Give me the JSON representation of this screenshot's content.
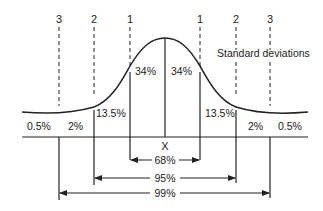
{
  "diagram": {
    "legend_label": "Standard deviations",
    "sd_labels": {
      "left_3": "3",
      "left_2": "2",
      "left_1": "1",
      "right_1": "1",
      "right_2": "2",
      "right_3": "3"
    },
    "regions": {
      "left_tail": "0.5%",
      "left_2sd": "2%",
      "left_13": "13.5%",
      "left_34": "34%",
      "right_34": "34%",
      "right_13": "13.5%",
      "right_2sd": "2%",
      "right_tail": "0.5%"
    },
    "mean_label": "X",
    "ranges": {
      "one_sd": "68%",
      "two_sd": "95%",
      "three_sd": "99%"
    },
    "colors": {
      "line": "#222222",
      "background": "#ffffff"
    }
  }
}
